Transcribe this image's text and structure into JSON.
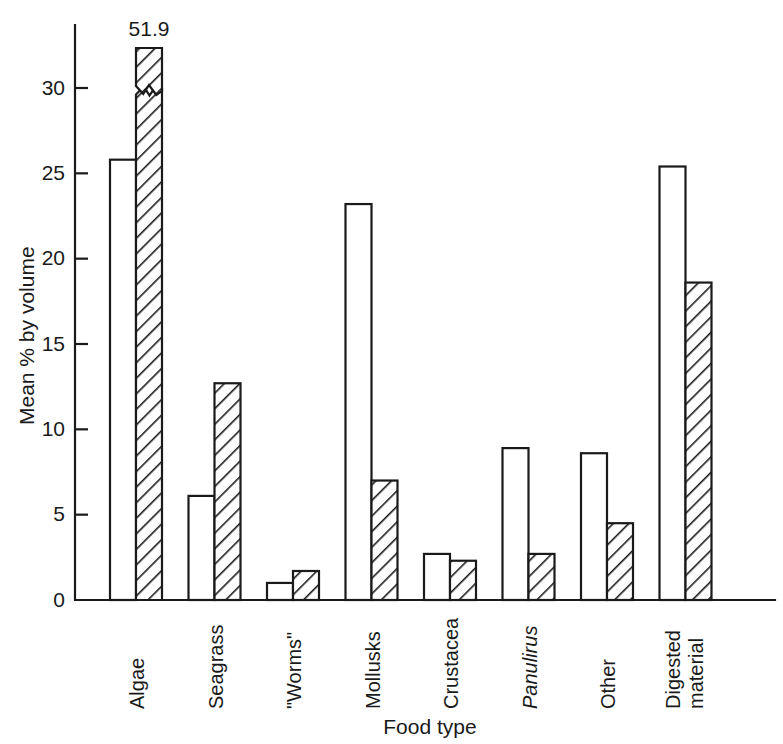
{
  "chart_data": {
    "type": "bar",
    "title": "",
    "xlabel": "Food type",
    "ylabel": "Mean % by volume",
    "categories": [
      "Algae",
      "Seagrass",
      "\"Worms\"",
      "Mollusks",
      "Crustacea",
      "Panulirus",
      "Other",
      "Digested material"
    ],
    "categories_style": [
      "normal",
      "normal",
      "normal",
      "normal",
      "normal",
      "italic",
      "normal",
      "normal"
    ],
    "series": [
      {
        "name": "open",
        "fill": "open",
        "values": [
          25.8,
          6.1,
          1.0,
          23.2,
          2.7,
          8.9,
          8.6,
          25.4
        ]
      },
      {
        "name": "hatched",
        "fill": "hatched",
        "values": [
          51.9,
          12.7,
          1.7,
          7.0,
          2.3,
          2.7,
          4.5,
          18.6
        ]
      }
    ],
    "annotations": [
      {
        "text": "51.9",
        "category": "Algae",
        "series": "hatched",
        "note": "broken-axis bar, true value exceeds axis maximum"
      }
    ],
    "ylim": [
      0,
      33
    ],
    "yticks": [
      0,
      5,
      10,
      15,
      20,
      25,
      30
    ],
    "ytick_labels": [
      "0",
      "5",
      "10",
      "15",
      "20",
      "25",
      "30"
    ],
    "grid": false,
    "legend": null,
    "broken_axis": true
  },
  "labels": {
    "value_51_9": "51.9",
    "y_axis_title": "Mean % by volume",
    "x_axis_title": "Food type",
    "digested_line1": "Digested",
    "digested_line2": "material"
  },
  "colors": {
    "ink": "#1a1a1a",
    "background": "#ffffff",
    "bar_fill_open": "#ffffff",
    "bar_hatch_stroke": "#1a1a1a"
  }
}
